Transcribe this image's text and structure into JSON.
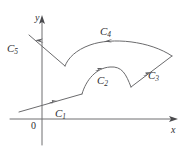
{
  "figure": {
    "type": "math-diagram",
    "background_color": "#ffffff",
    "stroke_color": "#6e6e70",
    "label_color": "#2f2f31",
    "axes": {
      "x_label": "x",
      "y_label": "y",
      "origin_label": "0",
      "x_axis": {
        "from": [
          10,
          119
        ],
        "to": [
          178,
          119
        ],
        "arrow": "right"
      },
      "y_axis": {
        "from": [
          42,
          143
        ],
        "to": [
          42,
          16
        ],
        "arrow": "up"
      }
    },
    "curves": [
      {
        "id": "C1",
        "label": "C",
        "subscript": "1",
        "label_pos": [
          55,
          108
        ],
        "description": "straight segment rising gently to the right",
        "arrow_direction": "up-right",
        "path": "M 19 112 L 82 94"
      },
      {
        "id": "C2",
        "label": "C",
        "subscript": "2",
        "label_pos": [
          97,
          75
        ],
        "description": "arc curving up and over to the right",
        "arrow_direction": "up-right",
        "path": "M 82 94 C 86 80, 96 68, 110 67 C 122 66, 126 74, 131 87"
      },
      {
        "id": "C3",
        "label": "C",
        "subscript": "3",
        "label_pos": [
          148,
          70
        ],
        "description": "straight segment rising steeply to the upper right",
        "arrow_direction": "up-right",
        "path": "M 131 87 L 172 56"
      },
      {
        "id": "C4",
        "label": "C",
        "subscript": "4",
        "label_pos": [
          100,
          26
        ],
        "description": "long arc sweeping leftwards across the top",
        "arrow_direction": "left",
        "path": "M 172 56 C 150 41, 112 37, 90 45 C 76 50, 68 58, 65 66"
      },
      {
        "id": "C5",
        "label": "C",
        "subscript": "5",
        "label_pos": [
          9,
          43
        ],
        "description": "straight segment running up and to the left across the y-axis",
        "arrow_direction": "up-left",
        "path": "M 65 66 L 29 35"
      }
    ]
  }
}
